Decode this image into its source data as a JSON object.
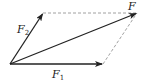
{
  "diagram": {
    "vectors": [
      {
        "name": "F1",
        "label": "F",
        "subscript": "1"
      },
      {
        "name": "F2",
        "label": "F",
        "subscript": "2"
      },
      {
        "name": "F",
        "label": "F",
        "subscript": ""
      }
    ],
    "colors": {
      "line": "#222222",
      "dashed": "#888888"
    }
  }
}
